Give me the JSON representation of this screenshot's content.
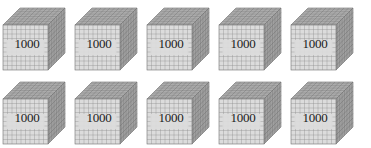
{
  "scene": {
    "title": "Base ten thousand-cubes",
    "background_color": "#ffffff",
    "width": 371,
    "height": 148
  },
  "manipulative": {
    "type": "base-ten-blocks",
    "block_name": "thousand-cube",
    "unit_value": 1000,
    "rows": 2,
    "columns": 5,
    "total_blocks": 10,
    "total_value": 10000
  },
  "colors": {
    "front_face": "#dcdcdc",
    "front_grid_line": "#8a8a8a",
    "top_face": "#b4b4b4",
    "top_grid_line": "#6e6e6e",
    "side_face": "#a8a8a8",
    "side_grid_line": "#676767",
    "outline": "#707070",
    "label_text": "#1b1b1b"
  },
  "grid": {
    "front_divisions": 10,
    "top_divisions": 10,
    "side_divisions": 10
  },
  "blocks": [
    {
      "label": "1000",
      "value": 1000,
      "row": 0,
      "column": 0
    },
    {
      "label": "1000",
      "value": 1000,
      "row": 0,
      "column": 1
    },
    {
      "label": "1000",
      "value": 1000,
      "row": 0,
      "column": 2
    },
    {
      "label": "1000",
      "value": 1000,
      "row": 0,
      "column": 3
    },
    {
      "label": "1000",
      "value": 1000,
      "row": 0,
      "column": 4
    },
    {
      "label": "1000",
      "value": 1000,
      "row": 1,
      "column": 0
    },
    {
      "label": "1000",
      "value": 1000,
      "row": 1,
      "column": 1
    },
    {
      "label": "1000",
      "value": 1000,
      "row": 1,
      "column": 2
    },
    {
      "label": "1000",
      "value": 1000,
      "row": 1,
      "column": 3
    },
    {
      "label": "1000",
      "value": 1000,
      "row": 1,
      "column": 4
    }
  ]
}
